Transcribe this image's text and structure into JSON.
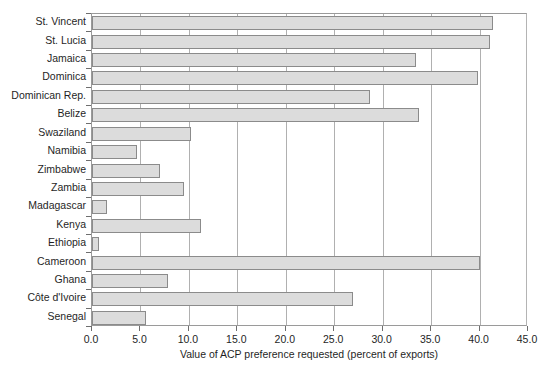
{
  "chart_data": {
    "type": "bar",
    "orientation": "horizontal",
    "title": "",
    "xlabel": "Value of ACP preference requested (percent of exports)",
    "ylabel": "",
    "xlim": [
      0.0,
      45.0
    ],
    "xticks": [
      "0.0",
      "5.0",
      "10.0",
      "15.0",
      "20.0",
      "25.0",
      "30.0",
      "35.0",
      "40.0",
      "45.0"
    ],
    "xtick_values": [
      0.0,
      5.0,
      10.0,
      15.0,
      20.0,
      25.0,
      30.0,
      35.0,
      40.0,
      45.0
    ],
    "grid": "vertical",
    "legend": "none",
    "categories": [
      "St. Vincent",
      "St. Lucia",
      "Jamaica",
      "Dominica",
      "Dominican Rep.",
      "Belize",
      "Swaziland",
      "Namibia",
      "Zimbabwe",
      "Zambia",
      "Madagascar",
      "Kenya",
      "Ethiopia",
      "Cameroon",
      "Ghana",
      "Côte d'Ivoire",
      "Senegal"
    ],
    "values": [
      41.4,
      41.1,
      33.4,
      39.8,
      28.7,
      33.7,
      10.2,
      4.6,
      7.0,
      9.5,
      1.5,
      11.3,
      0.7,
      40.0,
      7.8,
      26.9,
      5.6
    ],
    "colors": {
      "bar_fill": "#dcdcdc",
      "bar_border": "#8b8b8b",
      "gridline": "#b0b0b0",
      "axis": "#6e6e6e",
      "text": "#1f1f1f",
      "background": "#ffffff"
    }
  }
}
